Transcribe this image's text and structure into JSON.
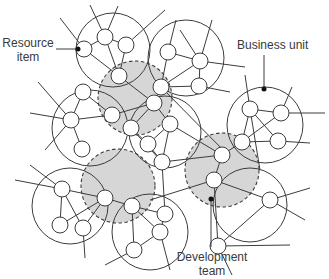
{
  "labels": {
    "resource_item": [
      "Resource",
      "item"
    ],
    "business_unit": "Business unit",
    "development_team": [
      "Development",
      "team"
    ]
  },
  "colors": {
    "line": "#3c3c3c",
    "team_fill": "#d6d6d6",
    "node_fill": "#ffffff",
    "background": "#ffffff",
    "text": "#3a3a3a"
  },
  "business_units": [
    {
      "id": "bu-top-left",
      "cx": 113,
      "cy": 50,
      "r": 37
    },
    {
      "id": "bu-top-center",
      "cx": 186,
      "cy": 58,
      "r": 38
    },
    {
      "id": "bu-left",
      "cx": 90,
      "cy": 128,
      "r": 38
    },
    {
      "id": "bu-center",
      "cx": 165,
      "cy": 132,
      "r": 36
    },
    {
      "id": "bu-right",
      "cx": 265,
      "cy": 125,
      "r": 38
    },
    {
      "id": "bu-bottom-left",
      "cx": 70,
      "cy": 206,
      "r": 38
    },
    {
      "id": "bu-bottom-center",
      "cx": 150,
      "cy": 232,
      "r": 38
    },
    {
      "id": "bu-bottom-right",
      "cx": 250,
      "cy": 205,
      "r": 37
    }
  ],
  "development_teams": [
    {
      "id": "team-top",
      "cx": 135,
      "cy": 98,
      "r": 37
    },
    {
      "id": "team-right",
      "cx": 222,
      "cy": 170,
      "r": 37
    },
    {
      "id": "team-left",
      "cx": 118,
      "cy": 186,
      "r": 37
    }
  ],
  "nodes": [
    [
      84,
      49
    ],
    [
      105,
      37
    ],
    [
      126,
      45
    ],
    [
      119,
      76
    ],
    [
      168,
      52
    ],
    [
      200,
      61
    ],
    [
      199,
      86
    ],
    [
      161,
      87
    ],
    [
      83,
      92
    ],
    [
      71,
      120
    ],
    [
      82,
      149
    ],
    [
      112,
      115
    ],
    [
      154,
      103
    ],
    [
      131,
      128
    ],
    [
      148,
      144
    ],
    [
      170,
      124
    ],
    [
      162,
      162
    ],
    [
      250,
      109
    ],
    [
      281,
      113
    ],
    [
      278,
      141
    ],
    [
      242,
      142
    ],
    [
      62,
      189
    ],
    [
      60,
      225
    ],
    [
      83,
      228
    ],
    [
      105,
      198
    ],
    [
      132,
      206
    ],
    [
      134,
      250
    ],
    [
      160,
      232
    ],
    [
      165,
      214
    ],
    [
      214,
      180
    ],
    [
      218,
      246
    ],
    [
      270,
      200
    ],
    [
      222,
      155
    ]
  ],
  "edges": [
    [
      0,
      1
    ],
    [
      1,
      2
    ],
    [
      0,
      3
    ],
    [
      1,
      3
    ],
    [
      2,
      3
    ],
    [
      4,
      5
    ],
    [
      4,
      7
    ],
    [
      5,
      7
    ],
    [
      6,
      7
    ],
    [
      5,
      6
    ],
    [
      8,
      9
    ],
    [
      9,
      10
    ],
    [
      9,
      11
    ],
    [
      8,
      11
    ],
    [
      11,
      12
    ],
    [
      12,
      3
    ],
    [
      12,
      13
    ],
    [
      13,
      14
    ],
    [
      14,
      15
    ],
    [
      15,
      12
    ],
    [
      13,
      16
    ],
    [
      14,
      16
    ],
    [
      16,
      15
    ],
    [
      17,
      18
    ],
    [
      17,
      19
    ],
    [
      18,
      20
    ],
    [
      20,
      19
    ],
    [
      17,
      20
    ],
    [
      21,
      22
    ],
    [
      21,
      23
    ],
    [
      22,
      24
    ],
    [
      23,
      24
    ],
    [
      21,
      24
    ],
    [
      25,
      26
    ],
    [
      25,
      27
    ],
    [
      26,
      27
    ],
    [
      27,
      28
    ],
    [
      25,
      28
    ],
    [
      29,
      30
    ],
    [
      29,
      31
    ],
    [
      30,
      31
    ],
    [
      29,
      32
    ],
    [
      32,
      20
    ],
    [
      32,
      16
    ],
    [
      24,
      25
    ],
    [
      16,
      28
    ],
    [
      12,
      7
    ],
    [
      15,
      32
    ]
  ],
  "spokes": [
    [
      [
        84,
        49
      ],
      [
        60,
        18
      ]
    ],
    [
      [
        105,
        37
      ],
      [
        90,
        5
      ]
    ],
    [
      [
        105,
        37
      ],
      [
        118,
        6
      ]
    ],
    [
      [
        126,
        45
      ],
      [
        165,
        10
      ]
    ],
    [
      [
        168,
        52
      ],
      [
        176,
        20
      ]
    ],
    [
      [
        200,
        61
      ],
      [
        212,
        20
      ]
    ],
    [
      [
        200,
        61
      ],
      [
        245,
        67
      ]
    ],
    [
      [
        199,
        86
      ],
      [
        230,
        92
      ]
    ],
    [
      [
        71,
        120
      ],
      [
        38,
        82
      ]
    ],
    [
      [
        71,
        120
      ],
      [
        30,
        113
      ]
    ],
    [
      [
        71,
        120
      ],
      [
        45,
        150
      ]
    ],
    [
      [
        250,
        109
      ],
      [
        245,
        75
      ]
    ],
    [
      [
        281,
        113
      ],
      [
        292,
        87
      ]
    ],
    [
      [
        281,
        113
      ],
      [
        325,
        113
      ]
    ],
    [
      [
        278,
        141
      ],
      [
        310,
        143
      ]
    ],
    [
      [
        250,
        109
      ],
      [
        260,
        170
      ]
    ],
    [
      [
        62,
        189
      ],
      [
        15,
        180
      ]
    ],
    [
      [
        62,
        189
      ],
      [
        30,
        165
      ]
    ],
    [
      [
        83,
        228
      ],
      [
        85,
        258
      ]
    ],
    [
      [
        134,
        250
      ],
      [
        105,
        265
      ]
    ],
    [
      [
        160,
        232
      ],
      [
        170,
        270
      ]
    ],
    [
      [
        214,
        180
      ],
      [
        150,
        200
      ]
    ],
    [
      [
        270,
        200
      ],
      [
        310,
        188
      ]
    ],
    [
      [
        270,
        200
      ],
      [
        305,
        220
      ]
    ],
    [
      [
        218,
        246
      ],
      [
        232,
        275
      ]
    ],
    [
      [
        218,
        246
      ],
      [
        290,
        245
      ]
    ],
    [
      [
        161,
        87
      ],
      [
        230,
        157
      ]
    ],
    [
      [
        200,
        61
      ],
      [
        180,
        30
      ]
    ]
  ],
  "callouts": {
    "resource_item": {
      "from": [
        56,
        49
      ],
      "to": [
        78,
        49
      ]
    },
    "business_unit": {
      "from": [
        264,
        55
      ],
      "to": [
        264,
        89
      ]
    },
    "development_team": {
      "from": [
        211,
        199
      ],
      "to": [
        211,
        247
      ]
    }
  },
  "node_radius": 8
}
